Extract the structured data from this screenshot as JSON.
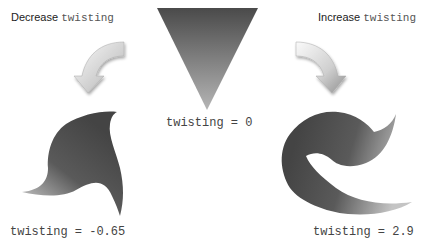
{
  "captions": {
    "decrease": {
      "word": "Decrease",
      "param": "twisting"
    },
    "increase": {
      "word": "Increase",
      "param": "twisting"
    }
  },
  "shapes": [
    {
      "name": "left-blade",
      "label": "twisting = -0.65",
      "twisting": -0.65
    },
    {
      "name": "center-triangle",
      "label": "twisting = 0",
      "twisting": 0
    },
    {
      "name": "right-spiral",
      "label": "twisting = 2.9",
      "twisting": 2.9
    }
  ],
  "arrows": [
    {
      "name": "decrease-arrow-icon",
      "direction": "curve-down-left"
    },
    {
      "name": "increase-arrow-icon",
      "direction": "curve-down-right"
    }
  ],
  "colors": {
    "shape_dark": "#4a4a4a",
    "shape_light": "#b8b8b8",
    "arrow_light": "#f4f4f4",
    "arrow_dark": "#9a9a9a"
  }
}
